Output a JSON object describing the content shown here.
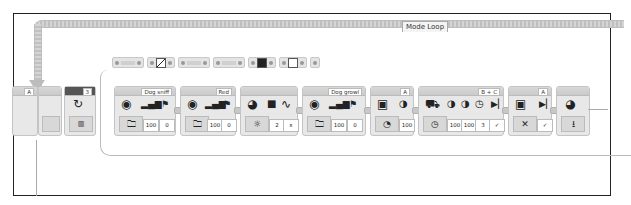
{
  "loop": {
    "label": "Mode Loop"
  },
  "start_blocks": [
    {
      "name": "motor-partial",
      "port": "A"
    },
    {
      "name": "loop-start",
      "port": "",
      "count": "3"
    }
  ],
  "param_groups": [
    "group1",
    "group2",
    "group3",
    "group4",
    "group5",
    "group6",
    "group7"
  ],
  "blocks": [
    {
      "name": "sound-block-1",
      "port": "Dog sniff",
      "icons": [
        "speaker",
        "volume",
        "play-type"
      ],
      "mode": "folder",
      "values": [
        "100",
        "0"
      ]
    },
    {
      "name": "sound-block-2",
      "port": "Red",
      "icons": [
        "speaker",
        "volume",
        "play-type"
      ],
      "mode": "folder",
      "values": [
        "100",
        "0"
      ]
    },
    {
      "name": "brick-light-block",
      "port": "",
      "icons": [
        "brick",
        "color",
        "pulse"
      ],
      "mode": "light-on",
      "values": [
        "2",
        "x"
      ]
    },
    {
      "name": "sound-block-3",
      "port": "Dog growl",
      "icons": [
        "speaker",
        "volume",
        "play-type"
      ],
      "mode": "folder",
      "values": [
        "100",
        "0"
      ]
    },
    {
      "name": "medium-motor-block",
      "port": "A",
      "icons": [
        "motor",
        "speed"
      ],
      "mode": "on",
      "values": [
        "100"
      ]
    },
    {
      "name": "move-tank-block",
      "port": "B + C",
      "icons": [
        "tank",
        "speed-left",
        "speed-right",
        "seconds",
        "brake"
      ],
      "mode": "on-for-seconds",
      "values": [
        "100",
        "100",
        "3",
        "✓"
      ]
    },
    {
      "name": "medium-motor-stop-block",
      "port": "A",
      "icons": [
        "motor",
        "brake"
      ],
      "mode": "off",
      "values": [
        "✓"
      ]
    },
    {
      "name": "brick-light-off-block",
      "port": "",
      "icons": [
        "brick"
      ],
      "mode": "reset",
      "values": []
    }
  ]
}
